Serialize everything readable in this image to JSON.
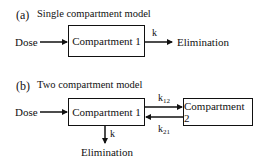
{
  "panel_a": {
    "tag": "(a)",
    "title": "Single compartment model",
    "input_label": "Dose",
    "compartment_label": "Compartment 1",
    "rate_label": "k",
    "output_label": "Elimination"
  },
  "panel_b": {
    "tag": "(b)",
    "title": "Two compartment model",
    "input_label": "Dose",
    "compartment1_label": "Compartment 1",
    "compartment2_label": "Compartment 2",
    "rate_12": {
      "base": "k",
      "sub": "12"
    },
    "rate_21": {
      "base": "k",
      "sub": "21"
    },
    "rate_elim": "k",
    "output_label": "Elimination"
  }
}
